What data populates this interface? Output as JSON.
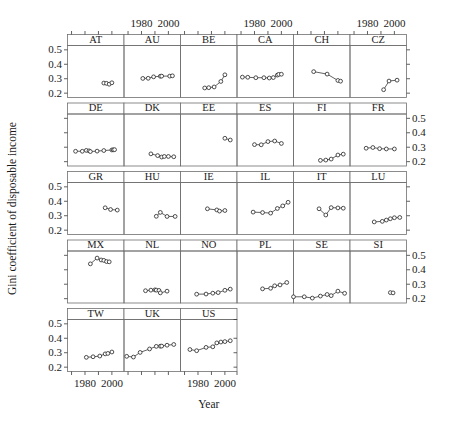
{
  "chart_data": {
    "type": "line",
    "title": "",
    "xlabel": "Year",
    "ylabel": "Gini coefficient of disposable income",
    "xlim": [
      1967,
      2009
    ],
    "ylim": [
      0.17,
      0.53
    ],
    "ytick_values": [
      0.2,
      0.3,
      0.4,
      0.5
    ],
    "ytick_labels": [
      "0.2",
      "0.3",
      "0.4",
      "0.5"
    ],
    "xtick_values": [
      1980,
      2000
    ],
    "xtick_labels": [
      "1980",
      "2000"
    ],
    "xtick_minor": [
      1970,
      1990,
      2010
    ],
    "grid": false,
    "legend": "none",
    "layout": {
      "rows": 5,
      "cols": 6,
      "panel_order": "row-major"
    },
    "marker": "open-circle",
    "panels": [
      {
        "name": "AT",
        "row": 1,
        "col": 1,
        "x": [
          1994,
          1996,
          1998,
          2000
        ],
        "y": [
          0.27,
          0.268,
          0.262,
          0.272
        ]
      },
      {
        "name": "AU",
        "row": 1,
        "col": 2,
        "x": [
          1981,
          1985,
          1989,
          1994,
          1995,
          2001,
          2003
        ],
        "y": [
          0.302,
          0.303,
          0.313,
          0.317,
          0.318,
          0.318,
          0.32
        ]
      },
      {
        "name": "BE",
        "row": 1,
        "col": 3,
        "x": [
          1985,
          1988,
          1992,
          1997,
          2000
        ],
        "y": [
          0.236,
          0.238,
          0.243,
          0.281,
          0.327
        ]
      },
      {
        "name": "CA",
        "row": 1,
        "col": 4,
        "x": [
          1971,
          1975,
          1981,
          1987,
          1991,
          1994,
          1997,
          1998,
          2000
        ],
        "y": [
          0.311,
          0.31,
          0.307,
          0.307,
          0.305,
          0.308,
          0.325,
          0.33,
          0.331
        ]
      },
      {
        "name": "CH",
        "row": 1,
        "col": 5,
        "x": [
          1982,
          1992,
          2000,
          2002
        ],
        "y": [
          0.349,
          0.332,
          0.288,
          0.283
        ]
      },
      {
        "name": "CZ",
        "row": 1,
        "col": 6,
        "x": [
          1992,
          1996,
          2002
        ],
        "y": [
          0.224,
          0.284,
          0.29
        ]
      },
      {
        "name": "DE",
        "row": 2,
        "col": 1,
        "x": [
          1973,
          1978,
          1981,
          1983,
          1984,
          1989,
          1994,
          2000,
          2001,
          2002
        ],
        "y": [
          0.272,
          0.272,
          0.278,
          0.275,
          0.27,
          0.273,
          0.277,
          0.281,
          0.282,
          0.283
        ]
      },
      {
        "name": "DK",
        "row": 2,
        "col": 2,
        "x": [
          1987,
          1992,
          1995,
          1997,
          2000,
          2004
        ],
        "y": [
          0.254,
          0.242,
          0.232,
          0.236,
          0.236,
          0.234
        ]
      },
      {
        "name": "EE",
        "row": 2,
        "col": 3,
        "x": [
          2000,
          2004
        ],
        "y": [
          0.362,
          0.35
        ]
      },
      {
        "name": "ES",
        "row": 2,
        "col": 4,
        "x": [
          1980,
          1985,
          1990,
          1995,
          2000
        ],
        "y": [
          0.318,
          0.317,
          0.339,
          0.343,
          0.326
        ]
      },
      {
        "name": "FI",
        "row": 2,
        "col": 5,
        "x": [
          1987,
          1991,
          1995,
          2000,
          2004
        ],
        "y": [
          0.209,
          0.211,
          0.218,
          0.246,
          0.252
        ]
      },
      {
        "name": "FR",
        "row": 2,
        "col": 6,
        "x": [
          1979,
          1984,
          1989,
          1994,
          2000
        ],
        "y": [
          0.293,
          0.298,
          0.29,
          0.288,
          0.288
        ]
      },
      {
        "name": "GR",
        "row": 3,
        "col": 1,
        "x": [
          1995,
          1999,
          2004
        ],
        "y": [
          0.355,
          0.343,
          0.339
        ]
      },
      {
        "name": "HU",
        "row": 3,
        "col": 2,
        "x": [
          1991,
          1994,
          1999,
          2005
        ],
        "y": [
          0.296,
          0.323,
          0.295,
          0.295
        ]
      },
      {
        "name": "IE",
        "row": 3,
        "col": 3,
        "x": [
          1987,
          1994,
          1996,
          2000
        ],
        "y": [
          0.348,
          0.34,
          0.332,
          0.336
        ]
      },
      {
        "name": "IL",
        "row": 3,
        "col": 4,
        "x": [
          1979,
          1986,
          1992,
          1997,
          2001,
          2005
        ],
        "y": [
          0.325,
          0.322,
          0.318,
          0.35,
          0.368,
          0.393
        ]
      },
      {
        "name": "IT",
        "row": 3,
        "col": 5,
        "x": [
          1986,
          1991,
          1995,
          2000,
          2004
        ],
        "y": [
          0.348,
          0.305,
          0.356,
          0.354,
          0.352
        ]
      },
      {
        "name": "LU",
        "row": 3,
        "col": 6,
        "x": [
          1985,
          1991,
          1994,
          1997,
          2000,
          2004
        ],
        "y": [
          0.257,
          0.261,
          0.27,
          0.279,
          0.286,
          0.288
        ]
      },
      {
        "name": "MX",
        "row": 4,
        "col": 1,
        "x": [
          1984,
          1989,
          1992,
          1994,
          1996,
          1998
        ],
        "y": [
          0.441,
          0.481,
          0.468,
          0.465,
          0.457,
          0.455
        ]
      },
      {
        "name": "NL",
        "row": 4,
        "col": 2,
        "x": [
          1983,
          1987,
          1990,
          1991,
          1993,
          1994,
          1999
        ],
        "y": [
          0.255,
          0.259,
          0.261,
          0.259,
          0.257,
          0.24,
          0.252
        ]
      },
      {
        "name": "NO",
        "row": 4,
        "col": 3,
        "x": [
          1979,
          1986,
          1991,
          1995,
          2000,
          2004
        ],
        "y": [
          0.231,
          0.232,
          0.238,
          0.242,
          0.258,
          0.266
        ]
      },
      {
        "name": "PL",
        "row": 4,
        "col": 4,
        "x": [
          1986,
          1992,
          1995,
          1999,
          2004
        ],
        "y": [
          0.268,
          0.272,
          0.289,
          0.295,
          0.312
        ]
      },
      {
        "name": "SE",
        "row": 4,
        "col": 5,
        "x": [
          1967,
          1975,
          1981,
          1987,
          1992,
          1995,
          2000,
          2005
        ],
        "y": [
          0.213,
          0.213,
          0.204,
          0.218,
          0.229,
          0.221,
          0.252,
          0.237
        ]
      },
      {
        "name": "SI",
        "row": 4,
        "col": 6,
        "x": [
          1997,
          1999
        ],
        "y": [
          0.242,
          0.24
        ]
      },
      {
        "name": "TW",
        "row": 5,
        "col": 1,
        "x": [
          1981,
          1986,
          1991,
          1995,
          1997,
          2000
        ],
        "y": [
          0.268,
          0.272,
          0.277,
          0.292,
          0.295,
          0.305
        ]
      },
      {
        "name": "UK",
        "row": 5,
        "col": 2,
        "x": [
          1969,
          1974,
          1979,
          1986,
          1991,
          1994,
          1995,
          1999,
          2004
        ],
        "y": [
          0.275,
          0.27,
          0.302,
          0.326,
          0.344,
          0.345,
          0.346,
          0.352,
          0.357
        ]
      },
      {
        "name": "US",
        "row": 5,
        "col": 3,
        "x": [
          1974,
          1979,
          1986,
          1991,
          1994,
          1997,
          2000,
          2004
        ],
        "y": [
          0.322,
          0.314,
          0.337,
          0.341,
          0.368,
          0.374,
          0.377,
          0.383
        ]
      }
    ]
  },
  "axes": {
    "ylabel": "Gini coefficient of disposable income",
    "xlabel": "Year",
    "ytick_labels": [
      "0.5",
      "0.4",
      "0.3",
      "0.2"
    ],
    "xtick_labels": [
      "1980",
      "2000"
    ]
  },
  "colors": {
    "marker_stroke": "#2e2e2e",
    "line": "#3a3a3a",
    "frame": "#6f6f6f",
    "background": "#ffffff",
    "text": "#1b1b1b"
  }
}
